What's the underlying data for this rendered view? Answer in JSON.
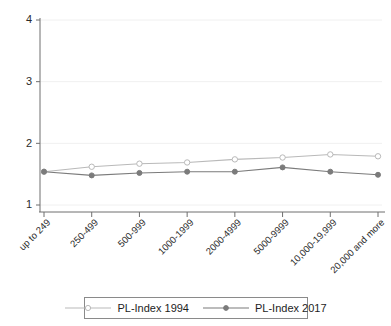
{
  "chart_data": {
    "type": "line",
    "title": "",
    "xlabel": "",
    "ylabel": "",
    "ylim": [
      1,
      4
    ],
    "yticks": [
      1,
      2,
      3,
      4
    ],
    "grid": true,
    "legend_position": "bottom",
    "categories": [
      "up to 249",
      "250-499",
      "500-999",
      "1000-1999",
      "2000-4999",
      "5000-9999",
      "10,000-19,999",
      "20,000 and more"
    ],
    "series": [
      {
        "name": "PL-Index 1994",
        "color": "#b9b9b9",
        "marker": "open-circle",
        "values": [
          1.54,
          1.62,
          1.67,
          1.69,
          1.74,
          1.77,
          1.82,
          1.79
        ]
      },
      {
        "name": "PL-Index 2017",
        "color": "#7b7b7b",
        "marker": "filled-circle",
        "values": [
          1.54,
          1.48,
          1.52,
          1.54,
          1.54,
          1.61,
          1.54,
          1.49
        ]
      }
    ]
  },
  "legend": {
    "items": [
      {
        "label": "PL-Index 1994"
      },
      {
        "label": "PL-Index 2017"
      }
    ]
  },
  "colors": {
    "series_1994": "#b9b9b9",
    "series_2017": "#7b7b7b",
    "axis": "#6f6f6f",
    "grid": "#f0f0f0",
    "background": "#ffffff"
  }
}
